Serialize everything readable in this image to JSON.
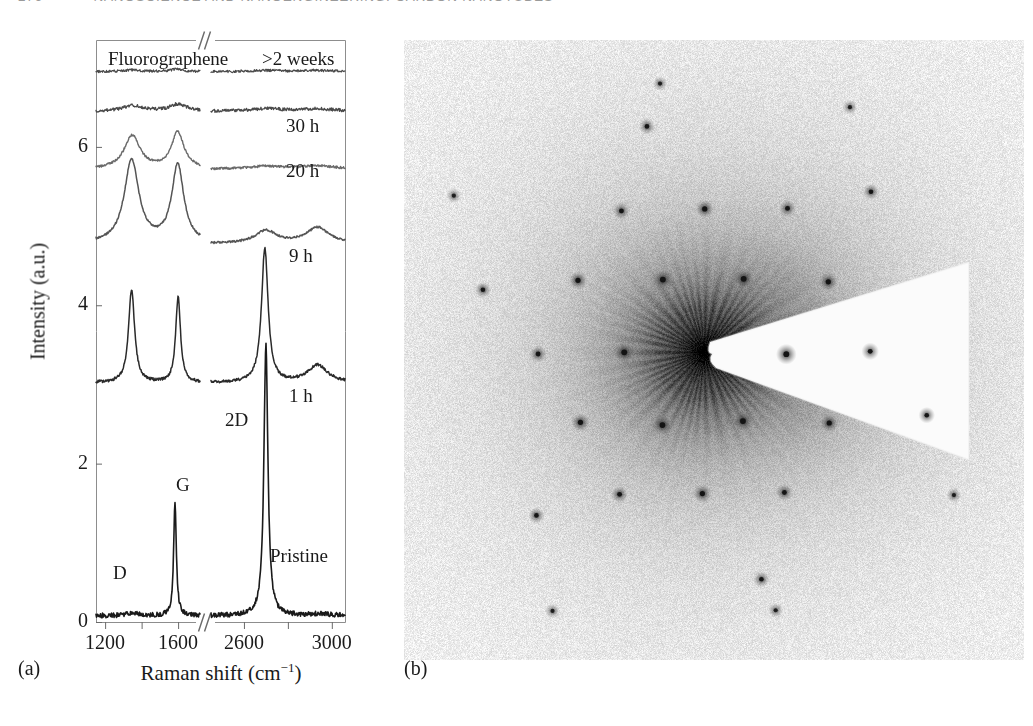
{
  "header": {
    "folio": "276",
    "running_title": "NANOSCIENCE AND NANOENGINEERING: CARBON NANOTUBES"
  },
  "figure": {
    "panel_a_caption": "(a)",
    "panel_b_caption": "(b)"
  },
  "chart_data": {
    "type": "line",
    "title": "",
    "xlabel": "Raman shift (cm−1)",
    "ylabel": "Intensity (a.u.)",
    "xtick_labels": [
      "1200",
      "1600",
      "2600",
      "3000"
    ],
    "ytick_labels": [
      "0",
      "2",
      "4",
      "6"
    ],
    "ylim": [
      0,
      7.35
    ],
    "grid": false,
    "axis_break": true,
    "segments": [
      {
        "name": "low",
        "xlim": [
          1150,
          1720
        ]
      },
      {
        "name": "high",
        "xlim": [
          2450,
          3060
        ]
      }
    ],
    "peak_annotations": [
      {
        "label": "D",
        "x_px": 113,
        "y_px": 562
      },
      {
        "label": "G",
        "x_px": 176,
        "y_px": 474
      },
      {
        "label": "2D",
        "x_px": 225,
        "y_px": 409
      },
      {
        "label": "Pristine",
        "x_px": 270,
        "y_px": 545
      }
    ],
    "series_labels": [
      {
        "label": "Fluorographene",
        "x_px": 108,
        "y_px": 48
      },
      {
        "label": ">2 weeks",
        "x_px": 262,
        "y_px": 48
      },
      {
        "label": "30 h",
        "x_px": 286,
        "y_px": 115
      },
      {
        "label": "20 h",
        "x_px": 286,
        "y_px": 160
      },
      {
        "label": "9 h",
        "x_px": 289,
        "y_px": 245
      },
      {
        "label": "1 h",
        "x_px": 289,
        "y_px": 385
      }
    ],
    "series": [
      {
        "name": ">2 weeks",
        "offset": 6.95,
        "color": "#4a4a4a",
        "width": 1.2,
        "noise": 0.016,
        "peaks_low": [
          {
            "c": 1350,
            "h": 0.02,
            "w": 60
          },
          {
            "c": 1590,
            "h": 0.03,
            "w": 45
          }
        ],
        "peaks_high": [
          {
            "c": 2700,
            "h": 0.015,
            "w": 80
          },
          {
            "c": 2930,
            "h": 0.015,
            "w": 90
          }
        ]
      },
      {
        "name": "30 h",
        "offset": 6.45,
        "color": "#4a4a4a",
        "width": 1.3,
        "noise": 0.02,
        "peaks_low": [
          {
            "c": 1350,
            "h": 0.07,
            "w": 70
          },
          {
            "c": 1600,
            "h": 0.09,
            "w": 55
          }
        ],
        "peaks_high": [
          {
            "c": 2700,
            "h": 0.03,
            "w": 90
          },
          {
            "c": 2930,
            "h": 0.03,
            "w": 100
          }
        ]
      },
      {
        "name": "20 h",
        "offset": 5.72,
        "color": "#6a6a6a",
        "width": 1.4,
        "noise": 0.014,
        "peaks_low": [
          {
            "c": 1348,
            "h": 0.42,
            "w": 52
          },
          {
            "c": 1598,
            "h": 0.46,
            "w": 42
          }
        ],
        "peaks_high": [
          {
            "c": 2700,
            "h": 0.035,
            "w": 90
          },
          {
            "c": 2935,
            "h": 0.04,
            "w": 95
          }
        ]
      },
      {
        "name": "9 h",
        "offset": 4.78,
        "color": "#555555",
        "width": 1.5,
        "noise": 0.013,
        "peaks_low": [
          {
            "c": 1345,
            "h": 1.05,
            "w": 48
          },
          {
            "c": 1598,
            "h": 0.98,
            "w": 40
          }
        ],
        "peaks_high": [
          {
            "c": 2700,
            "h": 0.16,
            "w": 58
          },
          {
            "c": 2935,
            "h": 0.2,
            "w": 62
          }
        ]
      },
      {
        "name": "1 h",
        "offset": 3.02,
        "color": "#2a2a2a",
        "width": 1.5,
        "noise": 0.018,
        "peaks_low": [
          {
            "c": 1345,
            "h": 1.18,
            "w": 20
          },
          {
            "c": 1600,
            "h": 1.08,
            "w": 16
          }
        ],
        "peaks_high": [
          {
            "c": 2695,
            "h": 1.7,
            "w": 18
          },
          {
            "c": 2935,
            "h": 0.22,
            "w": 55
          }
        ]
      },
      {
        "name": "Pristine",
        "offset": 0.08,
        "color": "#1a1a1a",
        "width": 1.6,
        "noise": 0.03,
        "peaks_low": [
          {
            "c": 1350,
            "h": 0.03,
            "w": 40
          },
          {
            "c": 1583,
            "h": 1.42,
            "w": 9
          }
        ],
        "peaks_high": [
          {
            "c": 2700,
            "h": 3.42,
            "w": 11
          },
          {
            "c": 2940,
            "h": 0.02,
            "w": 60
          }
        ]
      }
    ]
  },
  "diffraction": {
    "description": "selected-area electron diffraction pattern with beam stop",
    "background": "#f4f4f4",
    "spot_color": "#2b2b2b",
    "beamstop": "wedge",
    "spot_rings": [
      {
        "radius_px": 82,
        "count": 6,
        "start_deg": 0,
        "size": 4.0
      },
      {
        "radius_px": 143,
        "count": 6,
        "start_deg": 30,
        "size": 3.6
      },
      {
        "radius_px": 165,
        "count": 6,
        "start_deg": 0,
        "size": 3.4
      },
      {
        "radius_px": 232,
        "count": 6,
        "start_deg": 16,
        "size": 3.2
      }
    ]
  }
}
